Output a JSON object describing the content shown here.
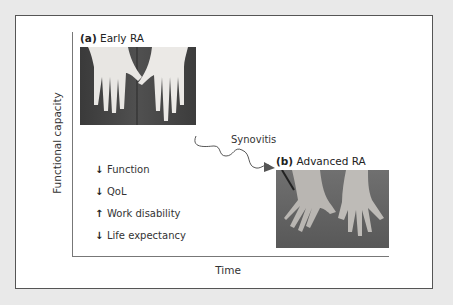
{
  "figure": {
    "y_axis_label": "Functional capacity",
    "x_axis_label": "Time",
    "panel_a": {
      "tag": "(a)",
      "label": "Early RA",
      "image": "photo of hands in early rheumatoid arthritis"
    },
    "panel_b": {
      "tag": "(b)",
      "label": "Advanced RA",
      "image": "photo of deformed hands in advanced rheumatoid arthritis"
    },
    "transition_label": "Synovitis",
    "outcomes": [
      {
        "direction": "down",
        "symbol": "↓",
        "label": "Function"
      },
      {
        "direction": "down",
        "symbol": "↓",
        "label": "QoL"
      },
      {
        "direction": "up",
        "symbol": "↑",
        "label": "Work disability"
      },
      {
        "direction": "down",
        "symbol": "↓",
        "label": "Life expectancy"
      }
    ]
  }
}
